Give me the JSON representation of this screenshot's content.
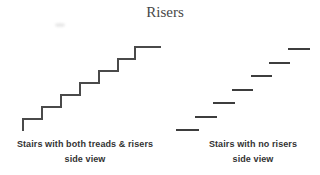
{
  "title": "Risers",
  "colors": {
    "background": "#ffffff",
    "title": "#474747",
    "text": "#333333",
    "stair_line": "#4a4a4a",
    "tread_line": "#3d3d3d"
  },
  "figures": {
    "left": {
      "type": "stairs-with-risers",
      "caption_line1": "Stairs with both treads & risers",
      "caption_line2": "side view",
      "step_count": 7,
      "polyline": [
        [
          23,
          131
        ],
        [
          23,
          119
        ],
        [
          42,
          119
        ],
        [
          42,
          107
        ],
        [
          61,
          107
        ],
        [
          61,
          95
        ],
        [
          80,
          95
        ],
        [
          80,
          83
        ],
        [
          99,
          83
        ],
        [
          99,
          71
        ],
        [
          118,
          71
        ],
        [
          118,
          59
        ],
        [
          135,
          59
        ],
        [
          135,
          47
        ],
        [
          161,
          47
        ]
      ]
    },
    "right": {
      "type": "stairs-no-risers",
      "caption_line1": "Stairs with no risers",
      "caption_line2": "side view",
      "tread_count": 7,
      "dashes": [
        {
          "x1": 176,
          "x2": 199,
          "y": 130
        },
        {
          "x1": 195,
          "x2": 217,
          "y": 117
        },
        {
          "x1": 213,
          "x2": 235,
          "y": 103
        },
        {
          "x1": 232,
          "x2": 253,
          "y": 90
        },
        {
          "x1": 251,
          "x2": 272,
          "y": 76
        },
        {
          "x1": 269,
          "x2": 290,
          "y": 63
        },
        {
          "x1": 288,
          "x2": 310,
          "y": 49
        }
      ]
    }
  }
}
